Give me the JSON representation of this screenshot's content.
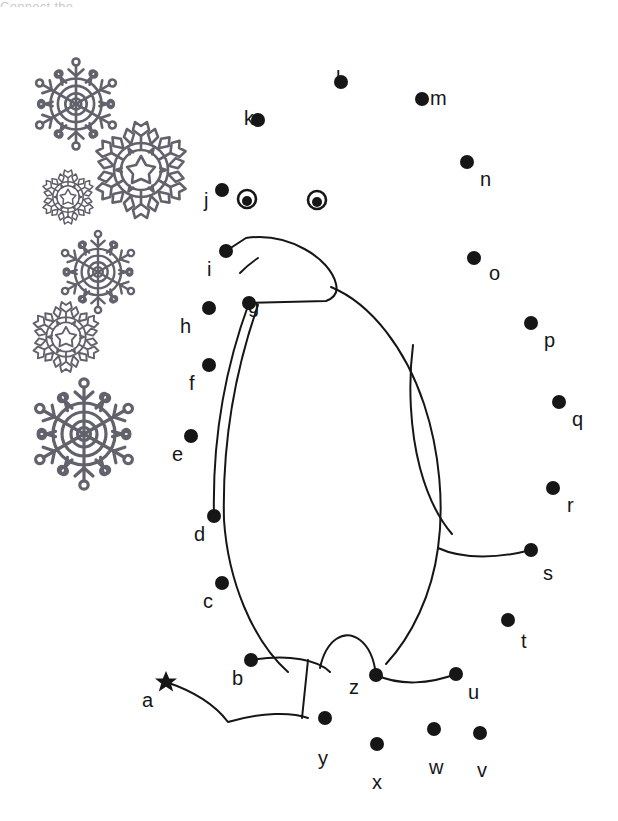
{
  "document": {
    "title_partial": "Connect the",
    "type": "connect-the-dots-worksheet",
    "subject": "penguin",
    "background_color": "#ffffff",
    "ink_color": "#161616",
    "snowflake_color": "#555560"
  },
  "puzzle": {
    "start_marker": "star",
    "start_letter": "a",
    "sequence": [
      "a",
      "b",
      "c",
      "d",
      "e",
      "f",
      "g",
      "h",
      "i",
      "j",
      "k",
      "l",
      "m",
      "n",
      "o",
      "p",
      "q",
      "r",
      "s",
      "t",
      "u",
      "v",
      "w",
      "x",
      "y",
      "z"
    ],
    "dots": [
      {
        "letter": "a",
        "x": 166,
        "y": 682,
        "marker": "star",
        "label_x": 142,
        "label_y": 690
      },
      {
        "letter": "b",
        "x": 251,
        "y": 660,
        "marker": "dot",
        "label_x": 232,
        "label_y": 668
      },
      {
        "letter": "c",
        "x": 222,
        "y": 583,
        "marker": "dot",
        "label_x": 203,
        "label_y": 591
      },
      {
        "letter": "d",
        "x": 214,
        "y": 516,
        "marker": "dot",
        "label_x": 194,
        "label_y": 524
      },
      {
        "letter": "e",
        "x": 191,
        "y": 436,
        "marker": "dot",
        "label_x": 172,
        "label_y": 444
      },
      {
        "letter": "f",
        "x": 209,
        "y": 365,
        "marker": "dot",
        "label_x": 189,
        "label_y": 373
      },
      {
        "letter": "g",
        "x": 249,
        "y": 303,
        "marker": "dot",
        "label_x": 248,
        "label_y": 296
      },
      {
        "letter": "h",
        "x": 209,
        "y": 308,
        "marker": "dot",
        "label_x": 180,
        "label_y": 316
      },
      {
        "letter": "i",
        "x": 226,
        "y": 251,
        "marker": "dot",
        "label_x": 207,
        "label_y": 259
      },
      {
        "letter": "j",
        "x": 222,
        "y": 190,
        "marker": "dot",
        "label_x": 204,
        "label_y": 190
      },
      {
        "letter": "k",
        "x": 258,
        "y": 120,
        "marker": "dot",
        "label_x": 244,
        "label_y": 108
      },
      {
        "letter": "l",
        "x": 341,
        "y": 82,
        "marker": "dot",
        "label_x": 336,
        "label_y": 68
      },
      {
        "letter": "m",
        "x": 422,
        "y": 99,
        "marker": "dot",
        "label_x": 430,
        "label_y": 88
      },
      {
        "letter": "n",
        "x": 467,
        "y": 162,
        "marker": "dot",
        "label_x": 480,
        "label_y": 169
      },
      {
        "letter": "o",
        "x": 474,
        "y": 258,
        "marker": "dot",
        "label_x": 489,
        "label_y": 263
      },
      {
        "letter": "p",
        "x": 531,
        "y": 323,
        "marker": "dot",
        "label_x": 544,
        "label_y": 330
      },
      {
        "letter": "q",
        "x": 559,
        "y": 402,
        "marker": "dot",
        "label_x": 572,
        "label_y": 409
      },
      {
        "letter": "r",
        "x": 553,
        "y": 488,
        "marker": "dot",
        "label_x": 567,
        "label_y": 495
      },
      {
        "letter": "s",
        "x": 531,
        "y": 550,
        "marker": "dot",
        "label_x": 543,
        "label_y": 563
      },
      {
        "letter": "t",
        "x": 508,
        "y": 620,
        "marker": "dot",
        "label_x": 521,
        "label_y": 631
      },
      {
        "letter": "u",
        "x": 456,
        "y": 674,
        "marker": "dot",
        "label_x": 468,
        "label_y": 682
      },
      {
        "letter": "v",
        "x": 480,
        "y": 733,
        "marker": "dot",
        "label_x": 477,
        "label_y": 760
      },
      {
        "letter": "w",
        "x": 434,
        "y": 729,
        "marker": "dot",
        "label_x": 429,
        "label_y": 757
      },
      {
        "letter": "x",
        "x": 377,
        "y": 744,
        "marker": "dot",
        "label_x": 372,
        "label_y": 772
      },
      {
        "letter": "y",
        "x": 325,
        "y": 718,
        "marker": "dot",
        "label_x": 318,
        "label_y": 748
      },
      {
        "letter": "z",
        "x": 376,
        "y": 675,
        "marker": "dot",
        "label_x": 349,
        "label_y": 677
      }
    ],
    "eyes": [
      {
        "name": "left-eye",
        "x": 247,
        "y": 199,
        "outer_r": 9,
        "pupil_r": 5
      },
      {
        "name": "right-eye",
        "x": 317,
        "y": 200,
        "outer_r": 9,
        "pupil_r": 5
      }
    ]
  },
  "decorations": {
    "snowflakes": [
      {
        "name": "snowflake-ring-large-top",
        "cx": 76,
        "cy": 104,
        "r": 42,
        "style": "ring",
        "opacity": 0.92
      },
      {
        "name": "snowflake-star-dense-upper",
        "cx": 141,
        "cy": 170,
        "r": 48,
        "style": "star",
        "opacity": 0.92
      },
      {
        "name": "snowflake-star-small",
        "cx": 68,
        "cy": 197,
        "r": 27,
        "style": "star",
        "opacity": 0.95
      },
      {
        "name": "snowflake-ring-mid",
        "cx": 98,
        "cy": 272,
        "r": 38,
        "style": "ring",
        "opacity": 0.92
      },
      {
        "name": "snowflake-star-mid",
        "cx": 66,
        "cy": 337,
        "r": 35,
        "style": "star",
        "opacity": 0.92
      },
      {
        "name": "snowflake-ring-large-bottom",
        "cx": 84,
        "cy": 434,
        "r": 51,
        "style": "ring",
        "opacity": 0.92
      }
    ]
  },
  "figure": {
    "name": "penguin-outline",
    "stroke_width": 2,
    "paths": {
      "head_beak": "M226,251 L246,238 C288,232 330,258 336,284 C338,292 334,298 326,301 L249,303",
      "beak_line": "M240,273 C246,267 252,262 258,258",
      "body_left": "M249,303 C228,360 212,430 214,516",
      "body_left_outer": "M258,305 C236,368 222,440 224,520 C228,580 252,640 288,672",
      "back_right": "M331,287 C372,304 406,350 424,404 C440,452 444,506 438,548 C432,594 412,636 386,664",
      "wing": "M413,345 C408,384 410,430 420,468 C428,498 440,520 452,534",
      "tail_to_s": "M438,548 C464,560 500,558 531,550",
      "foot_arc_z": "M320,668 C326,640 344,628 360,640 C368,646 374,658 376,675",
      "foot_left_b": "M251,660 C290,654 318,660 330,672",
      "foot_right_u": "M376,675 C400,686 430,684 456,674",
      "leg_line": "M308,660 L302,718",
      "tail_bottom": "M166,682 C196,692 216,706 228,722 C262,712 292,712 308,718"
    }
  }
}
